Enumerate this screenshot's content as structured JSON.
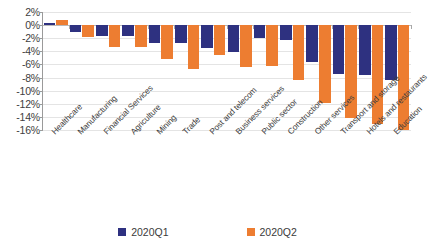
{
  "chart_data": {
    "type": "bar",
    "title": "",
    "subtitle": "",
    "xlabel": "",
    "ylabel": "",
    "ylim": [
      -16,
      2
    ],
    "ytick_step": 2,
    "ytick_labels": [
      "2%",
      "0%",
      "-2%",
      "-4%",
      "-6%",
      "-8%",
      "-10%",
      "-12%",
      "-14%",
      "-16%"
    ],
    "ytick_values": [
      2,
      0,
      -2,
      -4,
      -6,
      -8,
      -10,
      -12,
      -14,
      -16
    ],
    "grid": true,
    "legend_position": "bottom",
    "categories": [
      "Healthcare",
      "Manufacturing",
      "Financial Services",
      "Agriculture",
      "Mining",
      "Trade",
      "Post and telecom",
      "Business services",
      "Public sector",
      "Construction",
      "Other services",
      "Transport and storage",
      "Hotels and restaurants",
      "Education"
    ],
    "series": [
      {
        "name": "2020Q1",
        "color": "#2E3180",
        "values": [
          0.3,
          -1.0,
          -1.6,
          -1.6,
          -2.7,
          -2.8,
          -3.5,
          -4.1,
          -1.9,
          -2.2,
          -5.6,
          -7.4,
          -7.6,
          -8.3
        ]
      },
      {
        "name": "2020Q2",
        "color": "#ED7D31",
        "values": [
          0.8,
          -1.8,
          -3.4,
          -3.4,
          -5.1,
          -6.7,
          -4.6,
          -6.4,
          -6.3,
          -8.3,
          -11.9,
          -14.1,
          -15.1,
          -16.0
        ]
      }
    ]
  },
  "legend": {
    "items": [
      {
        "label": "2020Q1",
        "color": "#2E3180"
      },
      {
        "label": "2020Q2",
        "color": "#ED7D31"
      }
    ]
  }
}
